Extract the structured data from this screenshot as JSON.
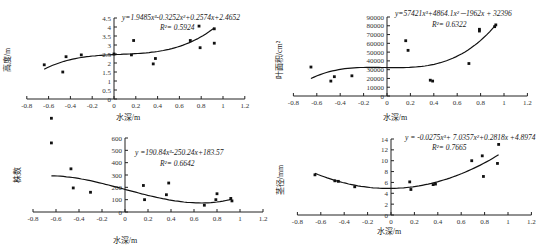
{
  "chart_data": [
    {
      "type": "scatter",
      "id": "height",
      "title": "",
      "xlabel": "水深/m",
      "ylabel": "高度/m",
      "xlim": [
        -0.8,
        1.2
      ],
      "ylim": [
        0,
        4.5
      ],
      "xticks": [
        "-0.8",
        "-0.6",
        "-0.4",
        "-0.2",
        "0",
        "0.2",
        "0.4",
        "0.6",
        "0.8",
        "1",
        "1.2"
      ],
      "yticks": [
        "0",
        "0.5",
        "1",
        "1.5",
        "2",
        "2.5",
        "3",
        "3.5",
        "4",
        "4.5"
      ],
      "equation": "y=1.9485x³-0.3252x²+0.2574x+2.4652",
      "r2": "R²= 0.5924",
      "fit": {
        "type": "poly3",
        "coef": [
          1.9485,
          -0.3252,
          0.2574,
          2.4652
        ],
        "xrange": [
          -0.64,
          0.92
        ]
      },
      "points": [
        [
          -0.64,
          1.9
        ],
        [
          -0.47,
          1.5
        ],
        [
          -0.44,
          2.35
        ],
        [
          -0.3,
          2.45
        ],
        [
          0,
          2.5
        ],
        [
          0.16,
          2.45
        ],
        [
          0.18,
          3.25
        ],
        [
          0.36,
          1.95
        ],
        [
          0.38,
          2.25
        ],
        [
          0.7,
          3.25
        ],
        [
          0.78,
          4.05
        ],
        [
          0.79,
          2.85
        ],
        [
          0.92,
          3.9
        ],
        [
          0.92,
          3.1
        ]
      ]
    },
    {
      "type": "scatter",
      "id": "leaf-area",
      "title": "",
      "xlabel": "水深/m",
      "ylabel": "叶面积/cm²",
      "xlim": [
        -0.8,
        1.2
      ],
      "ylim": [
        0,
        90000
      ],
      "xticks": [
        "-0.8",
        "-0.6",
        "-0.4",
        "-0.2",
        "0",
        "0.2",
        "0.4",
        "0.6",
        "0.8",
        "1",
        "1.2"
      ],
      "yticks": [
        "0",
        "10000",
        "20000",
        "30000",
        "40000",
        "50000",
        "60000",
        "70000",
        "80000",
        "90000"
      ],
      "equation": "y=57421x³+4864.1x²－1962x + 32396",
      "r2": "R²= 0.6322",
      "fit": {
        "type": "poly3",
        "coef": [
          57421,
          4864.1,
          -1962,
          32396
        ],
        "xrange": [
          -0.65,
          0.93
        ]
      },
      "points": [
        [
          -0.65,
          33000
        ],
        [
          -0.48,
          17000
        ],
        [
          -0.45,
          22000
        ],
        [
          -0.3,
          23000
        ],
        [
          0.16,
          63000
        ],
        [
          0.18,
          52000
        ],
        [
          0.37,
          18000
        ],
        [
          0.39,
          17000
        ],
        [
          0.7,
          37000
        ],
        [
          0.79,
          76000
        ],
        [
          0.79,
          74000
        ],
        [
          0.92,
          79000
        ],
        [
          0.93,
          81000
        ]
      ]
    },
    {
      "type": "scatter",
      "id": "plant-count",
      "title": "",
      "xlabel": "水深/m",
      "ylabel": "株数",
      "xlim": [
        -0.8,
        1.2
      ],
      "ylim": [
        0,
        600
      ],
      "xticks": [
        "-0.8",
        "-0.6",
        "-0.4",
        "-0.2",
        "0",
        "0.2",
        "0.4",
        "0.6",
        "0.8",
        "1",
        "1.2"
      ],
      "yticks": [
        "0",
        "100",
        "200",
        "300",
        "400",
        "500",
        "600"
      ],
      "equation": "y =190.84x³-250.24x+183.57",
      "r2": "R²= 0.6642",
      "fit": {
        "type": "poly3",
        "coef": [
          190.84,
          0,
          -250.24,
          183.57
        ],
        "xrange": [
          -0.64,
          0.93
        ]
      },
      "points": [
        [
          -0.64,
          760
        ],
        [
          -0.64,
          560
        ],
        [
          -0.47,
          350
        ],
        [
          -0.45,
          195
        ],
        [
          -0.3,
          160
        ],
        [
          0.16,
          215
        ],
        [
          0.17,
          100
        ],
        [
          0.36,
          140
        ],
        [
          0.38,
          235
        ],
        [
          0.69,
          55
        ],
        [
          0.79,
          100
        ],
        [
          0.8,
          148
        ],
        [
          0.92,
          110
        ],
        [
          0.93,
          90
        ]
      ]
    },
    {
      "type": "scatter",
      "id": "stem-diameter",
      "title": "",
      "xlabel": "水深/m",
      "ylabel": "茎径/mm",
      "xlim": [
        -0.8,
        1.2
      ],
      "ylim": [
        0,
        14
      ],
      "xticks": [
        "-0.8",
        "-0.6",
        "-0.4",
        "-0.2",
        "0",
        "0.2",
        "0.4",
        "0.6",
        "0.8",
        "1",
        "1.2"
      ],
      "yticks": [
        "0",
        "2",
        "4",
        "6",
        "8",
        "10",
        "12",
        "14"
      ],
      "equation": "y = -0.0275x³+ 7.0357x²+0.2818x +4.8974",
      "r2": "R²= 0.7665",
      "fit": {
        "type": "poly3",
        "coef": [
          -0.0275,
          7.0357,
          0.2818,
          4.8974
        ],
        "xrange": [
          -0.65,
          0.92
        ]
      },
      "points": [
        [
          -0.65,
          7.4
        ],
        [
          -0.48,
          6.3
        ],
        [
          -0.45,
          6.2
        ],
        [
          -0.31,
          5.2
        ],
        [
          0.16,
          6.1
        ],
        [
          0.17,
          4.7
        ],
        [
          0.36,
          5.6
        ],
        [
          0.38,
          5.7
        ],
        [
          0.69,
          10.0
        ],
        [
          0.78,
          10.9
        ],
        [
          0.79,
          7.1
        ],
        [
          0.92,
          13.0
        ],
        [
          0.91,
          9.5
        ]
      ]
    }
  ]
}
